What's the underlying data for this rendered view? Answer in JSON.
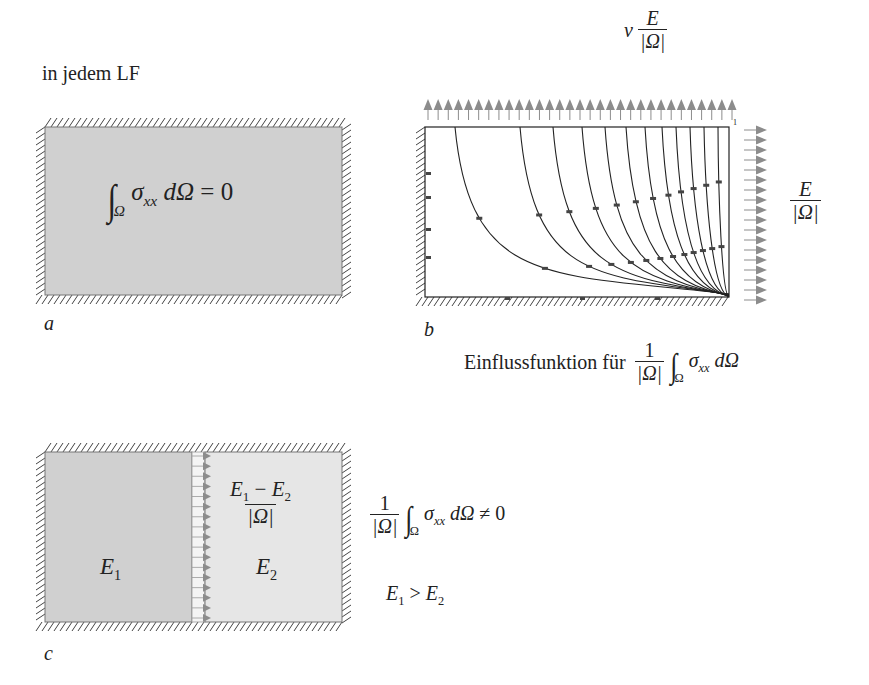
{
  "header": {
    "label": "in jedem LF"
  },
  "panel_a": {
    "tag": "a",
    "equation": {
      "integral_sub": "Ω",
      "integrand": "σ",
      "integrand_sub": "xx",
      "differential": "dΩ",
      "relation": "= 0"
    },
    "fill_color": "#d0d0d0"
  },
  "panel_b": {
    "tag": "b",
    "top_load": {
      "coef": "ν",
      "num": "E",
      "den": "|Ω|"
    },
    "right_load": {
      "num": "E",
      "den": "|Ω|"
    },
    "corner_mark": "1",
    "caption": {
      "text": "Einflussfunktion für",
      "num": "1",
      "den": "|Ω|",
      "integral_sub": "Ω",
      "integrand": "σ",
      "integrand_sub": "xx",
      "differential": "dΩ"
    },
    "top_arrow_count": 31,
    "right_arrow_count": 18,
    "contour_count": 12
  },
  "panel_c": {
    "tag": "c",
    "left_block": {
      "label": "E",
      "sub": "1",
      "fill_color": "#d0d0d0"
    },
    "right_block": {
      "label": "E",
      "sub": "2",
      "fill_color": "#e6e6e6"
    },
    "interface_load": {
      "num_a": "E",
      "num_a_sub": "1",
      "minus": " − ",
      "num_b": "E",
      "num_b_sub": "2",
      "den": "|Ω|"
    },
    "result": {
      "num": "1",
      "den": "|Ω|",
      "integral_sub": "Ω",
      "integrand": "σ",
      "integrand_sub": "xx",
      "differential": "dΩ",
      "relation": "≠ 0"
    },
    "condition": {
      "a": "E",
      "a_sub": "1",
      "op": " > ",
      "b": "E",
      "b_sub": "2"
    }
  },
  "colors": {
    "arrow": "#8c8c8c",
    "hatch": "#444444",
    "line": "#222222"
  }
}
